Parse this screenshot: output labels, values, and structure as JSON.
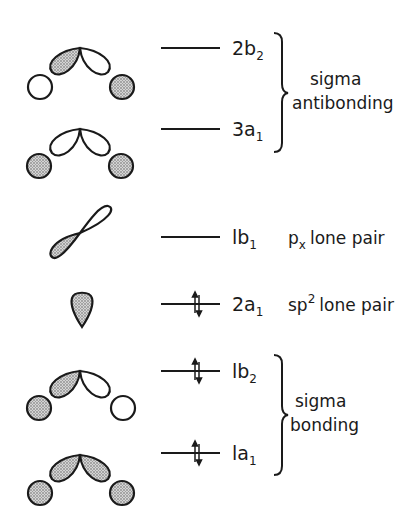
{
  "diagram": {
    "type": "molecular-orbital-energy-diagram",
    "fill_color": "#b8b8b8",
    "line_color": "#1a1a1a",
    "levels": [
      {
        "label": "2b",
        "subscript": "2",
        "occupied": false,
        "group": "sigma antibonding"
      },
      {
        "label": "3a",
        "subscript": "1",
        "occupied": false,
        "group": "sigma antibonding"
      },
      {
        "label": "lb",
        "subscript": "1",
        "occupied": false,
        "description": "p",
        "description_sub": "x",
        "description_rest": "lone pair"
      },
      {
        "label": "2a",
        "subscript": "1",
        "occupied": true,
        "description": "sp",
        "description_sup": "2",
        "description_rest": "lone pair"
      },
      {
        "label": "lb",
        "subscript": "2",
        "occupied": true,
        "group": "sigma bonding"
      },
      {
        "label": "la",
        "subscript": "1",
        "occupied": true,
        "group": "sigma bonding"
      }
    ],
    "groups": [
      {
        "line1": "sigma",
        "line2": "antibonding"
      },
      {
        "line1": "sigma",
        "line2": "bonding"
      }
    ]
  }
}
